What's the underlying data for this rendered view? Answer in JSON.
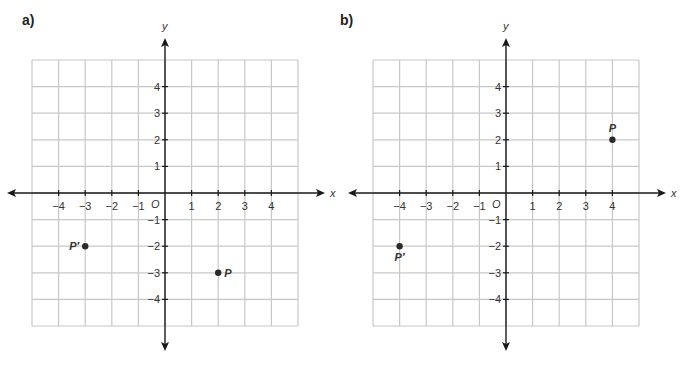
{
  "chart_data": [
    {
      "type": "scatter",
      "panel_label": "a)",
      "title": "",
      "xlabel": "x",
      "ylabel": "y",
      "origin_label": "O",
      "xlim": [
        -5,
        5
      ],
      "ylim": [
        -5,
        5
      ],
      "grid": true,
      "x_ticks": [
        -4,
        -3,
        -2,
        -1,
        1,
        2,
        3,
        4
      ],
      "y_ticks": [
        4,
        3,
        2,
        1,
        -1,
        -2,
        -3,
        -4
      ],
      "points": [
        {
          "name": "P",
          "x": 2,
          "y": -3,
          "label_pos": "right"
        },
        {
          "name": "P′",
          "x": -3,
          "y": -2,
          "label_pos": "left"
        }
      ]
    },
    {
      "type": "scatter",
      "panel_label": "b)",
      "title": "",
      "xlabel": "x",
      "ylabel": "y",
      "origin_label": "O",
      "xlim": [
        -5,
        5
      ],
      "ylim": [
        -5,
        5
      ],
      "grid": true,
      "x_ticks": [
        -4,
        -3,
        -2,
        -1,
        1,
        2,
        3,
        4
      ],
      "y_ticks": [
        4,
        3,
        2,
        1,
        -1,
        -2,
        -3,
        -4
      ],
      "points": [
        {
          "name": "P",
          "x": 4,
          "y": 2,
          "label_pos": "above"
        },
        {
          "name": "P′",
          "x": -4,
          "y": -2,
          "label_pos": "below"
        }
      ]
    }
  ],
  "colors": {
    "grid": "#c8c8c8",
    "axis": "#1a1a1a",
    "point": "#2a2a2a"
  }
}
